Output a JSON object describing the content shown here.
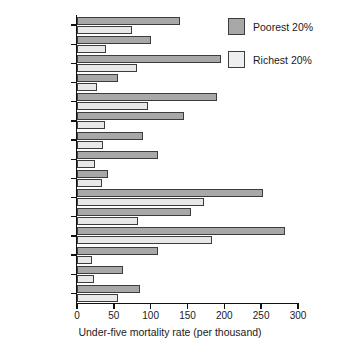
{
  "chart_data": {
    "type": "bar",
    "orientation": "horizontal",
    "title": "",
    "xlabel": "Under-five mortality rate (per thousand)",
    "ylabel": "",
    "xlim": [
      0,
      300
    ],
    "xticks": [
      0,
      50,
      100,
      150,
      200,
      250,
      300
    ],
    "xticklabels": [
      "0",
      "50",
      "100",
      "150",
      "200",
      "250",
      "300"
    ],
    "grid": false,
    "legend_position": "top-right",
    "categories": [
      "Bangladesh",
      "Brazil",
      "Cameroon",
      "Colombia",
      "Cote d'Ivoire",
      "Egypt",
      "Guatemala",
      "Indonesia",
      "Kazakhstan",
      "Malawi",
      "Nepal",
      "Niger",
      "Peru",
      "Vietnam",
      "Zimbabwe"
    ],
    "series": [
      {
        "name": "Poorest 20%",
        "color": "#a8a8a8",
        "values": [
          140,
          100,
          195,
          55,
          190,
          145,
          90,
          110,
          42,
          253,
          155,
          282,
          110,
          63,
          85
        ]
      },
      {
        "name": "Richest 20%",
        "color": "#e8e8e8",
        "values": [
          75,
          40,
          82,
          27,
          97,
          38,
          35,
          24,
          34,
          172,
          83,
          183,
          20,
          23,
          56
        ]
      }
    ]
  },
  "legend": {
    "entries": [
      {
        "label": "Poorest 20%",
        "swatch": "poorest"
      },
      {
        "label": "Richest 20%",
        "swatch": "richest"
      }
    ]
  }
}
